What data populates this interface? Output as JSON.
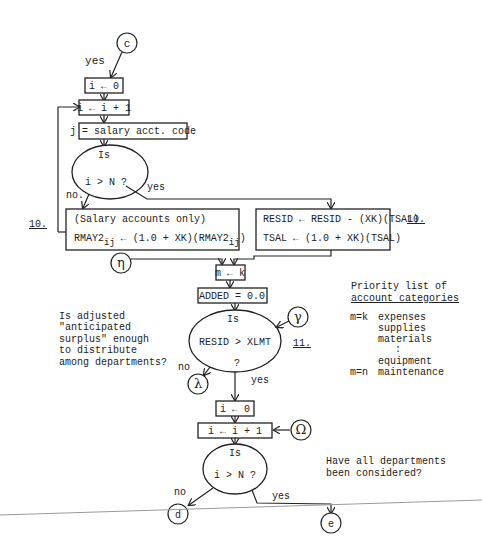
{
  "connectors": {
    "c": "c",
    "eta": "η",
    "gamma": "γ",
    "lambda": "λ",
    "omega": "Ω",
    "d": "d",
    "e": "e"
  },
  "edges": {
    "yes_top": "yes",
    "no_1": "no.",
    "yes_1": "yes",
    "no_2": "no",
    "yes_2": "yes",
    "no_3": "no",
    "yes_3": "yes"
  },
  "boxes": {
    "init_i": "i ← 0",
    "incr_i": "i ← i + 1",
    "salary_code": "j = salary acct. code",
    "salary_only": "(Salary accounts only)",
    "rmay_lhs": "RMAY2",
    "rmay_sub": "ij",
    "rmay_mid": " ← (1.0 + XK)(RMAY2",
    "rmay_end": ")",
    "resid_update": "RESID ← RESID - (XK)(TSAL)",
    "tsal_update": "TSAL ← (1.0 + XK)(TSAL)",
    "m_k": "m ← k",
    "added": "ADDED = 0.0",
    "init_i2": "i ← 0",
    "incr_i2": "i ← i + 1"
  },
  "decisions": {
    "d1_line1": "Is",
    "d1_line2": "i > N ?",
    "d2_line1": "Is",
    "d2_line2": "RESID > XLMT",
    "d2_line3": "?",
    "d3_line1": "Is",
    "d3_line2": "i > N ?"
  },
  "step_labels": {
    "left_10": "10.",
    "right_10": "10.",
    "step_11": "11."
  },
  "notes": {
    "surplus": [
      "Is adjusted",
      "\"anticipated",
      "surplus\" enough",
      "to distribute",
      "among departments?"
    ],
    "departments": [
      "Have all departments",
      "been considered?"
    ]
  },
  "priority_list": {
    "title_1": "Priority list of",
    "title_2": "account categories",
    "rows": [
      {
        "key": "m=k",
        "value": "expenses"
      },
      {
        "key": "",
        "value": "supplies"
      },
      {
        "key": "",
        "value": "materials"
      },
      {
        "key": "",
        "value": ":"
      },
      {
        "key": "",
        "value": "equipment"
      },
      {
        "key": "m=n",
        "value": "maintenance"
      }
    ]
  }
}
